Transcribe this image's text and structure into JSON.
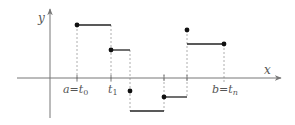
{
  "diagram": {
    "type": "step-function",
    "axes": {
      "x_label": "x",
      "y_label": "y",
      "origin": [
        50,
        78
      ],
      "x_axis": {
        "from": 17,
        "to": 282,
        "y": 78
      },
      "y_axis": {
        "x": 50,
        "from": 118,
        "to": 8
      }
    },
    "tick_labels": [
      {
        "text_main": "a",
        "text_eq": "=",
        "text_t": "t",
        "sub": "0",
        "x": 77
      },
      {
        "text_t": "t",
        "sub": "1",
        "x": 111
      },
      {
        "text_main": "b",
        "text_eq": "=",
        "text_t": "t",
        "sub": "n",
        "x": 224
      }
    ],
    "partition_x": [
      77,
      111,
      130,
      164,
      187,
      224
    ],
    "steps": [
      {
        "x1": 77,
        "x2": 111,
        "y": 25
      },
      {
        "x1": 111,
        "x2": 130,
        "y": 50
      },
      {
        "x1": 130,
        "x2": 164,
        "y": 111
      },
      {
        "x1": 164,
        "x2": 187,
        "y": 97
      },
      {
        "x1": 187,
        "x2": 224,
        "y": 44
      }
    ],
    "dots": [
      {
        "x": 77,
        "y": 25
      },
      {
        "x": 111,
        "y": 50
      },
      {
        "x": 130,
        "y": 91
      },
      {
        "x": 164,
        "y": 97
      },
      {
        "x": 187,
        "y": 30
      },
      {
        "x": 224,
        "y": 44
      }
    ],
    "colors": {
      "axis": "#777777",
      "step": "#222222",
      "dashed": "#999999",
      "dot": "#111111",
      "label": "#555555"
    }
  }
}
